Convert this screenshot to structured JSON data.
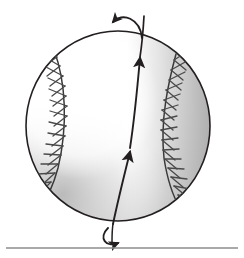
{
  "figure": {
    "background_color": "#ffffff",
    "ink_color": "#231f20",
    "caption": "",
    "ball": {
      "name": "baseball",
      "center_x": 118,
      "center_y": 126,
      "radius_x": 93,
      "radius_y": 96,
      "outline_color": "#231f20",
      "outline_width": 1.6,
      "highlight_color": "#ffffff",
      "shadow_color": "#9a9a9a",
      "shade_description": "white highlight upper-left, gray shading toward right and lower-left rim"
    },
    "seams": {
      "name": "baseball-seams",
      "count": 2,
      "stitch_color": "#4a4a4a",
      "seam_color": "#3a3a3a",
      "stitch_pairs_per_seam": 15,
      "left_seam_label": "left-seam",
      "right_seam_label": "right-seam"
    },
    "axis": {
      "name": "rotation-axis",
      "label": "",
      "color": "#231f20",
      "width": 2,
      "arrowheads": 2,
      "direction": "upward",
      "top_x": 140,
      "top_y": 57,
      "bottom_x": 113,
      "bottom_y": 224
    },
    "spin_arrows": [
      {
        "name": "top-spin-arrow",
        "position": "top",
        "direction": "counterclockwise-left",
        "color": "#231f20"
      },
      {
        "name": "bottom-spin-arrow",
        "position": "bottom",
        "direction": "counterclockwise-right",
        "color": "#231f20"
      }
    ],
    "rule": {
      "name": "horizontal-rule",
      "y": 248,
      "x_start": 6,
      "x_end": 238,
      "color": "#8c8c8c",
      "width": 1.4
    }
  }
}
